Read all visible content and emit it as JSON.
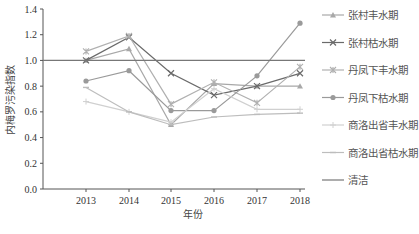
{
  "chart_data": {
    "type": "line",
    "title": "",
    "xlabel": "年份",
    "ylabel": "内梅罗污染指数",
    "x": [
      "2013",
      "2014",
      "2015",
      "2016",
      "2017",
      "2018"
    ],
    "ylim": [
      0,
      1.4
    ],
    "yticks": [
      "0.0",
      "0.2",
      "0.4",
      "0.6",
      "0.8",
      "1.0",
      "1.2",
      "1.4"
    ],
    "grid": false,
    "legend_position": "right",
    "series": [
      {
        "name": "张村丰水期",
        "marker": "triangle",
        "color": "#a8a8a8",
        "values": [
          1.0,
          1.09,
          0.5,
          0.82,
          0.8,
          0.8
        ]
      },
      {
        "name": "张村枯水期",
        "marker": "x",
        "color": "#6a6a6a",
        "values": [
          1.0,
          1.18,
          0.9,
          0.73,
          0.8,
          0.9
        ]
      },
      {
        "name": "丹凤下丰水期",
        "marker": "star",
        "color": "#b0b0b0",
        "values": [
          1.07,
          1.19,
          0.66,
          0.83,
          0.67,
          0.95
        ]
      },
      {
        "name": "丹凤下枯水期",
        "marker": "circle",
        "color": "#9a9a9a",
        "values": [
          0.84,
          0.92,
          0.61,
          0.61,
          0.88,
          1.29
        ]
      },
      {
        "name": "商洛出省丰水期",
        "marker": "plus",
        "color": "#d0d0d0",
        "values": [
          0.68,
          0.6,
          0.52,
          0.78,
          0.62,
          0.62
        ]
      },
      {
        "name": "商洛出省枯水期",
        "marker": "dash",
        "color": "#bdbdbd",
        "values": [
          0.79,
          0.6,
          0.5,
          0.56,
          0.58,
          0.59
        ]
      },
      {
        "name": "清洁",
        "marker": "none",
        "color": "#777777",
        "values": [
          1.0,
          1.0,
          1.0,
          1.0,
          1.0,
          1.0
        ]
      }
    ]
  }
}
